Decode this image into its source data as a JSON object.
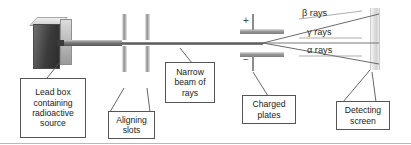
{
  "figure": {
    "background_color": "#ffffff",
    "width": 411,
    "height": 145
  },
  "apparatus": {
    "lead_box": {
      "name": "lead-box",
      "face_color": "#3b3b3b",
      "side_color": "#bdbdbd"
    },
    "beam": {
      "name": "narrow-beam",
      "color": "#5e5e5e"
    },
    "aligning_slots": {
      "name": "aligning-slots",
      "count": 2,
      "color": "#8d8d8d"
    },
    "charged_plates": {
      "name": "charged-plates",
      "count": 2,
      "color": "#9d9d9d"
    },
    "detecting_screen": {
      "name": "detecting-screen",
      "color": "#e2e2e2"
    }
  },
  "polarity": {
    "top_plate_sign": "+",
    "bottom_plate_sign": "−"
  },
  "rays": [
    {
      "id": "beta",
      "label": "β rays",
      "deflection": "upward",
      "color": "#555555"
    },
    {
      "id": "gamma",
      "label": "γ rays",
      "deflection": "undeflected",
      "color": "#555555"
    },
    {
      "id": "alpha",
      "label": "α rays",
      "deflection": "downward",
      "color": "#555555"
    }
  ],
  "callouts": [
    {
      "id": "lead-box",
      "lines": [
        "Lead box",
        "containing",
        "radioactive",
        "source"
      ]
    },
    {
      "id": "aligning-slots",
      "lines": [
        "Aligning",
        "slots"
      ]
    },
    {
      "id": "narrow-beam",
      "lines": [
        "Narrow",
        "beam of",
        "rays"
      ]
    },
    {
      "id": "charged-plates",
      "lines": [
        "Charged",
        "plates"
      ]
    },
    {
      "id": "detecting-screen",
      "lines": [
        "Detecting",
        "screen"
      ]
    }
  ]
}
